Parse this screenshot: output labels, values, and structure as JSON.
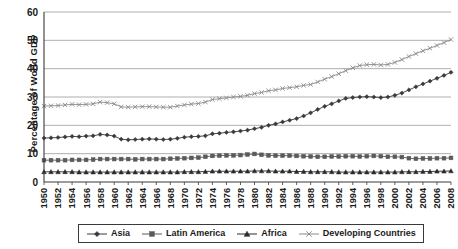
{
  "chart_data": {
    "type": "line",
    "title": "",
    "xlabel": "",
    "ylabel": "Percentage of  World GDP",
    "ylim": [
      0,
      60
    ],
    "yticks": [
      0,
      10,
      20,
      30,
      40,
      50,
      60
    ],
    "xlim": [
      1950,
      2008
    ],
    "grid": "horizontal",
    "legend_position": "bottom",
    "x": [
      1950,
      1951,
      1952,
      1953,
      1954,
      1955,
      1956,
      1957,
      1958,
      1959,
      1960,
      1961,
      1962,
      1963,
      1964,
      1965,
      1966,
      1967,
      1968,
      1969,
      1970,
      1971,
      1972,
      1973,
      1974,
      1975,
      1976,
      1977,
      1978,
      1979,
      1980,
      1981,
      1982,
      1983,
      1984,
      1985,
      1986,
      1987,
      1988,
      1989,
      1990,
      1991,
      1992,
      1993,
      1994,
      1995,
      1996,
      1997,
      1998,
      1999,
      2000,
      2001,
      2002,
      2003,
      2004,
      2005,
      2006,
      2007,
      2008
    ],
    "xtick_labels": [
      "1950",
      "1952",
      "1954",
      "1956",
      "1958",
      "1960",
      "1962",
      "1964",
      "1966",
      "1968",
      "1970",
      "1972",
      "1974",
      "1976",
      "1978",
      "1980",
      "1982",
      "1984",
      "1986",
      "1988",
      "1990",
      "1992",
      "1994",
      "1996",
      "1998",
      "2000",
      "2002",
      "2004",
      "2006",
      "2008"
    ],
    "series": [
      {
        "name": "Asia",
        "marker": "diamond",
        "color": "#3a3a3a",
        "values": [
          15.5,
          15.6,
          15.7,
          15.9,
          16.1,
          16.0,
          16.2,
          16.3,
          16.8,
          16.6,
          16.2,
          15.1,
          14.9,
          15.0,
          15.1,
          15.2,
          15.1,
          15.0,
          15.1,
          15.4,
          15.8,
          16.0,
          16.1,
          16.3,
          17.0,
          17.2,
          17.5,
          17.7,
          18.0,
          18.3,
          18.8,
          19.3,
          20.0,
          20.5,
          21.2,
          21.8,
          22.4,
          23.3,
          24.4,
          25.6,
          26.7,
          27.6,
          28.6,
          29.5,
          29.8,
          30.0,
          30.1,
          30.0,
          29.8,
          30.0,
          30.6,
          31.4,
          32.5,
          33.6,
          34.6,
          35.6,
          36.6,
          37.6,
          38.7
        ]
      },
      {
        "name": "Latin America",
        "marker": "square",
        "color": "#5a5a5a",
        "values": [
          7.7,
          7.7,
          7.7,
          7.7,
          7.8,
          7.8,
          7.8,
          7.9,
          8.1,
          8.1,
          8.1,
          8.1,
          8.1,
          8.0,
          8.1,
          8.1,
          8.1,
          8.1,
          8.2,
          8.3,
          8.4,
          8.5,
          8.6,
          8.9,
          9.2,
          9.3,
          9.4,
          9.4,
          9.5,
          9.7,
          9.9,
          9.6,
          9.4,
          9.3,
          9.3,
          9.3,
          9.2,
          9.1,
          9.0,
          8.9,
          8.9,
          9.0,
          9.0,
          9.1,
          9.1,
          9.0,
          9.1,
          9.2,
          9.1,
          8.9,
          8.9,
          8.8,
          8.4,
          8.2,
          8.3,
          8.3,
          8.4,
          8.4,
          8.5
        ]
      },
      {
        "name": "Africa",
        "marker": "triangle",
        "color": "#2a2a2a",
        "values": [
          3.6,
          3.6,
          3.6,
          3.6,
          3.6,
          3.5,
          3.5,
          3.5,
          3.5,
          3.5,
          3.5,
          3.5,
          3.5,
          3.5,
          3.5,
          3.5,
          3.5,
          3.5,
          3.5,
          3.5,
          3.6,
          3.6,
          3.6,
          3.7,
          3.8,
          3.8,
          3.8,
          3.8,
          3.8,
          3.8,
          3.9,
          3.9,
          3.9,
          3.8,
          3.8,
          3.8,
          3.7,
          3.7,
          3.6,
          3.6,
          3.6,
          3.6,
          3.5,
          3.5,
          3.5,
          3.5,
          3.5,
          3.5,
          3.5,
          3.5,
          3.5,
          3.6,
          3.6,
          3.6,
          3.7,
          3.7,
          3.8,
          3.8,
          3.9
        ]
      },
      {
        "name": "Developing Countries",
        "marker": "x",
        "color": "#8a8a8a",
        "values": [
          26.8,
          26.9,
          27.0,
          27.2,
          27.4,
          27.3,
          27.4,
          27.6,
          28.2,
          28.0,
          27.6,
          26.5,
          26.4,
          26.5,
          26.6,
          26.6,
          26.5,
          26.4,
          26.4,
          26.8,
          27.2,
          27.5,
          27.7,
          28.2,
          29.1,
          29.4,
          29.7,
          30.0,
          30.2,
          30.6,
          31.2,
          31.6,
          32.2,
          32.5,
          33.0,
          33.3,
          33.6,
          34.1,
          34.4,
          35.3,
          36.3,
          37.2,
          38.2,
          39.3,
          40.3,
          41.1,
          41.4,
          41.5,
          41.3,
          41.5,
          42.2,
          43.2,
          44.3,
          45.3,
          46.3,
          47.2,
          48.2,
          49.2,
          50.3
        ]
      }
    ]
  },
  "legend": {
    "items": [
      {
        "label": "Asia",
        "marker": "diamond"
      },
      {
        "label": "Latin America",
        "marker": "square"
      },
      {
        "label": "Africa",
        "marker": "triangle"
      },
      {
        "label": "Developing Countries",
        "marker": "x"
      }
    ]
  }
}
